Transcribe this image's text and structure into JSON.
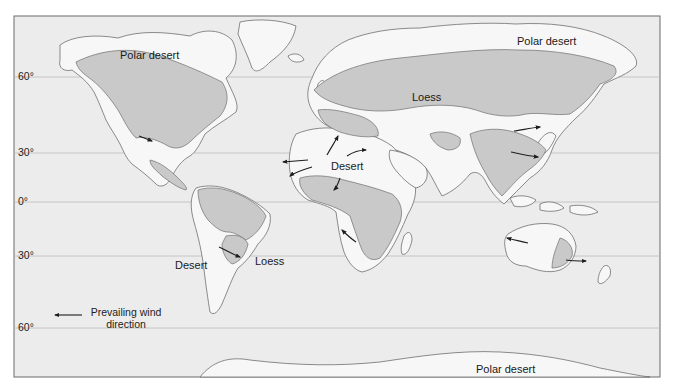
{
  "map": {
    "colors": {
      "ocean": "#ececec",
      "land": "#f7f7f7",
      "region_shaded": "#c9c9c9",
      "coast": "#6f6f6f",
      "gridline": "#bcbcbc",
      "frame": "#6b6b6b",
      "arrow": "#1e1e1e"
    },
    "latitude_labels": [
      "60°",
      "30°",
      "0°",
      "30°",
      "60°"
    ],
    "region_labels": {
      "polar_desert_na": "Polar desert",
      "polar_desert_asia": "Polar desert",
      "polar_desert_antarctica": "Polar desert",
      "loess_asia": "Loess",
      "loess_sa": "Loess",
      "desert_africa": "Desert",
      "desert_sa": "Desert"
    },
    "legend": {
      "line1": "Prevailing wind",
      "line2": "direction",
      "icon": "arrow-left-icon"
    }
  }
}
